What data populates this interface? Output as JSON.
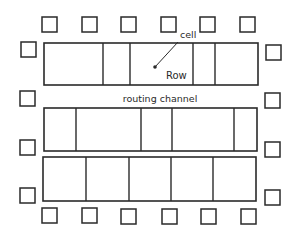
{
  "diagram": {
    "type": "standard-cell layout",
    "labels": {
      "cell": "cell",
      "row": "Row",
      "channel": "routing channel"
    },
    "colors": {
      "stroke": "#2a2a2a",
      "background": "#ffffff"
    },
    "rows": [
      {
        "name": "row-1",
        "x": 44,
        "y": 43,
        "w": 214,
        "h": 42,
        "dividers": [
          103,
          130,
          193,
          215
        ]
      },
      {
        "name": "row-2",
        "x": 44,
        "y": 108,
        "w": 213,
        "h": 43,
        "dividers": [
          76,
          141,
          172,
          234
        ]
      },
      {
        "name": "row-3",
        "x": 43,
        "y": 157,
        "w": 213,
        "h": 44,
        "dividers": [
          86,
          129,
          171,
          213
        ]
      }
    ],
    "pads": {
      "size": 15,
      "top": [
        [
          42,
          17
        ],
        [
          82,
          17
        ],
        [
          121,
          17
        ],
        [
          161,
          17
        ],
        [
          200,
          17
        ],
        [
          240,
          17
        ]
      ],
      "bottom": [
        [
          42,
          208
        ],
        [
          82,
          208
        ],
        [
          121,
          209
        ],
        [
          162,
          209
        ],
        [
          201,
          209
        ],
        [
          241,
          209
        ]
      ],
      "left": [
        [
          21,
          42
        ],
        [
          20,
          91
        ],
        [
          20,
          140
        ],
        [
          20,
          188
        ]
      ],
      "right": [
        [
          266,
          45
        ],
        [
          265,
          93
        ],
        [
          265,
          142
        ],
        [
          265,
          190
        ]
      ]
    },
    "annotation": {
      "dot": [
        155,
        67
      ],
      "leader_end": [
        178,
        42
      ]
    }
  }
}
